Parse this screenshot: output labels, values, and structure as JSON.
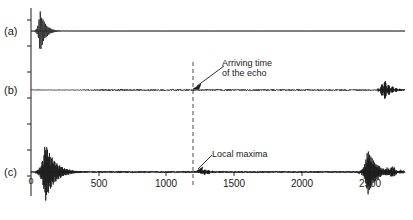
{
  "figure": {
    "title": "",
    "background": "#ffffff",
    "ink": "#1a1a1a"
  },
  "labels": {
    "trace_a": "(a)",
    "trace_b": "(b)",
    "trace_c": "(c)",
    "origin": "0"
  },
  "annotations": {
    "echo": {
      "line1": "Arriving time",
      "line2": "of the echo"
    },
    "maxima": {
      "text": "Local maxima"
    }
  },
  "axis": {
    "ticks": [
      "500",
      "1000",
      "1500",
      "2000",
      "2500"
    ],
    "tick_values": [
      500,
      1000,
      1500,
      2000,
      2500
    ]
  },
  "chart_data": {
    "type": "line",
    "title": "",
    "xlabel": "",
    "ylabel": "",
    "xlim": [
      0,
      2500
    ],
    "grid": false,
    "legend": "none",
    "tick_labels": [
      "500",
      "1000",
      "1500",
      "2000",
      "2500"
    ],
    "tick_values": [
      500,
      1000,
      1500,
      2000,
      2500
    ],
    "markers": [
      {
        "name": "arriving-time-of-the-echo",
        "type": "vertical-dashed-line",
        "x": 1130,
        "label": "Arriving time of the echo"
      },
      {
        "name": "local-maxima",
        "type": "point-annotation",
        "x": 1150,
        "label": "Local maxima"
      }
    ],
    "series": [
      {
        "name": "(a)",
        "panel": "a",
        "description": "Short damped transmitted pulse at origin, flat afterwards",
        "bursts": [
          {
            "center": 60,
            "width": 110,
            "amplitude": 1.0,
            "frequency": 0.115,
            "decay": 0.03
          }
        ]
      },
      {
        "name": "(b)",
        "panel": "b",
        "description": "Delayed wave packet, low-level coda, weak echo at 1130, late burst at 2350",
        "bursts": [
          {
            "center": 225,
            "width": 230,
            "amplitude": 0.62,
            "frequency": 0.3,
            "decay": 0.011
          },
          {
            "center": 1180,
            "width": 140,
            "amplitude": 0.07,
            "frequency": 0.3,
            "decay": 0.02
          },
          {
            "center": 2355,
            "width": 150,
            "amplitude": 0.33,
            "frequency": 0.32,
            "decay": 0.022
          }
        ],
        "noise_amplitude": 0.025
      },
      {
        "name": "(c)",
        "panel": "c",
        "description": "Large direct arrival at origin, decaying coda, local maxima at 1150, strong late burst near 2250",
        "bursts": [
          {
            "center": 95,
            "width": 190,
            "amplitude": 1.0,
            "frequency": 0.22,
            "decay": 0.016
          },
          {
            "center": 300,
            "width": 220,
            "amplitude": 0.2,
            "frequency": 0.3,
            "decay": 0.012
          },
          {
            "center": 1150,
            "width": 130,
            "amplitude": 0.105,
            "frequency": 0.32,
            "decay": 0.02
          },
          {
            "center": 2250,
            "width": 220,
            "amplitude": 0.8,
            "frequency": 0.24,
            "decay": 0.018
          },
          {
            "center": 2400,
            "width": 180,
            "amplitude": 0.2,
            "frequency": 0.34,
            "decay": 0.02
          }
        ],
        "noise_amplitude": 0.035
      }
    ]
  },
  "geometry": {
    "axis_x_px": 31,
    "right_px": 405,
    "baseline_a_px": 31,
    "baseline_b_px": 90,
    "baseline_c_px": 172,
    "tick_px": [
      99,
      166,
      234,
      302,
      370
    ],
    "echo_line_px": 193
  }
}
